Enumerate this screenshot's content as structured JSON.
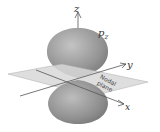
{
  "diagram": {
    "labels": {
      "z_axis": "z",
      "y_axis": "y",
      "x_axis": "x",
      "orbital": "p",
      "orbital_sub": "z",
      "plane_line1": "Nodal",
      "plane_line2": "plane"
    },
    "colors": {
      "lobe": "#9a9a9a",
      "plane": "#d8d8d8",
      "axis": "#555555"
    }
  }
}
